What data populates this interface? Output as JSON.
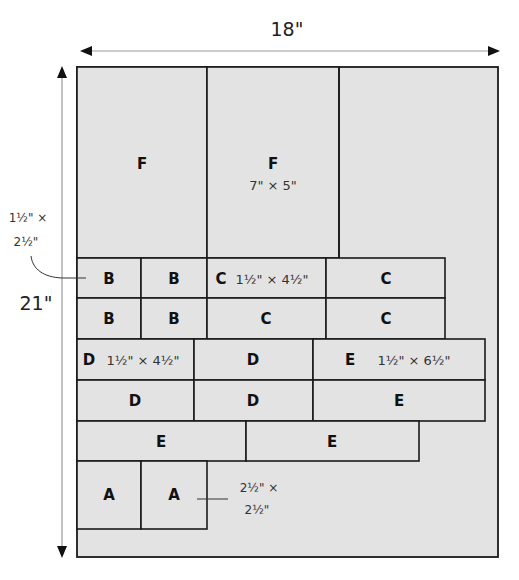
{
  "dimensions": {
    "width_label": "18\"",
    "height_label": "21\""
  },
  "colors": {
    "panel_fill": "#e3e3e3",
    "piece_fill": "#e3e3e3",
    "line": "#1a1a1a",
    "arrow": "#9a9a9a"
  },
  "pieces": {
    "F": {
      "label": "F",
      "size": "7\" × 5\""
    },
    "B": {
      "label": "B",
      "size_line1": "1½\" ×",
      "size_line2": "2½\""
    },
    "C": {
      "label": "C",
      "size": "1½\" × 4½\""
    },
    "D": {
      "label": "D",
      "size": "1½\" × 4½\""
    },
    "E": {
      "label": "E",
      "size": "1½\" × 6½\""
    },
    "A": {
      "label": "A",
      "size_line1": "2½\" ×",
      "size_line2": "2½\""
    }
  }
}
